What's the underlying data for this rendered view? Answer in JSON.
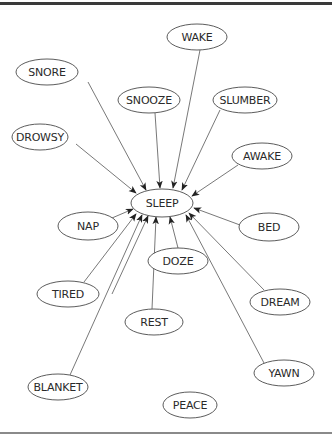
{
  "diagram": {
    "type": "semantic-association-network",
    "center": {
      "id": "sleep",
      "label": "SLEEP",
      "cx": 162,
      "cy": 203,
      "rx": 31,
      "ry": 14
    },
    "nodes": [
      {
        "id": "wake",
        "label": "WAKE",
        "cx": 197,
        "cy": 37,
        "rx": 30,
        "ry": 13
      },
      {
        "id": "snore",
        "label": "SNORE",
        "cx": 47,
        "cy": 72,
        "rx": 31,
        "ry": 13
      },
      {
        "id": "snooze",
        "label": "SNOOZE",
        "cx": 149,
        "cy": 100,
        "rx": 31,
        "ry": 13
      },
      {
        "id": "slumber",
        "label": "SLUMBER",
        "cx": 245,
        "cy": 100,
        "rx": 32,
        "ry": 13
      },
      {
        "id": "drowsy",
        "label": "DROWSY",
        "cx": 40,
        "cy": 137,
        "rx": 28,
        "ry": 13
      },
      {
        "id": "awake",
        "label": "AWAKE",
        "cx": 262,
        "cy": 156,
        "rx": 30,
        "ry": 13
      },
      {
        "id": "nap",
        "label": "NAP",
        "cx": 88,
        "cy": 226,
        "rx": 30,
        "ry": 14
      },
      {
        "id": "bed",
        "label": "BED",
        "cx": 269,
        "cy": 227,
        "rx": 30,
        "ry": 14
      },
      {
        "id": "doze",
        "label": "DOZE",
        "cx": 178,
        "cy": 261,
        "rx": 30,
        "ry": 13
      },
      {
        "id": "tired",
        "label": "TIRED",
        "cx": 68,
        "cy": 294,
        "rx": 31,
        "ry": 13
      },
      {
        "id": "dream",
        "label": "DREAM",
        "cx": 280,
        "cy": 302,
        "rx": 30,
        "ry": 13
      },
      {
        "id": "rest",
        "label": "REST",
        "cx": 154,
        "cy": 322,
        "rx": 29,
        "ry": 13
      },
      {
        "id": "blanket",
        "label": "BLANKET",
        "cx": 58,
        "cy": 387,
        "rx": 30,
        "ry": 13
      },
      {
        "id": "yawn",
        "label": "YAWN",
        "cx": 284,
        "cy": 373,
        "rx": 30,
        "ry": 13
      },
      {
        "id": "peace",
        "label": "PEACE",
        "cx": 190,
        "cy": 405,
        "rx": 27,
        "ry": 13
      }
    ],
    "edges": [
      {
        "from": "wake",
        "to": "sleep",
        "x1": 200,
        "y1": 50,
        "x2": 173,
        "y2": 188
      },
      {
        "from": "snore",
        "to": "sleep",
        "x1": 88,
        "y1": 82,
        "x2": 146,
        "y2": 190
      },
      {
        "from": "snooze",
        "to": "sleep",
        "x1": 155,
        "y1": 113,
        "x2": 160,
        "y2": 188
      },
      {
        "from": "slumber",
        "to": "sleep",
        "x1": 220,
        "y1": 110,
        "x2": 182,
        "y2": 190
      },
      {
        "from": "drowsy",
        "to": "sleep",
        "x1": 76,
        "y1": 144,
        "x2": 136,
        "y2": 193
      },
      {
        "from": "awake",
        "to": "sleep",
        "x1": 238,
        "y1": 165,
        "x2": 192,
        "y2": 196
      },
      {
        "from": "nap",
        "to": "sleep",
        "x1": 112,
        "y1": 218,
        "x2": 133,
        "y2": 209
      },
      {
        "from": "bed",
        "to": "sleep",
        "x1": 240,
        "y1": 225,
        "x2": 194,
        "y2": 208
      },
      {
        "from": "doze",
        "to": "sleep",
        "x1": 178,
        "y1": 248,
        "x2": 170,
        "y2": 217
      },
      {
        "from": "tired",
        "to": "sleep",
        "x1": 84,
        "y1": 282,
        "x2": 136,
        "y2": 214
      },
      {
        "from": "dream",
        "to": "sleep",
        "x1": 264,
        "y1": 290,
        "x2": 189,
        "y2": 213
      },
      {
        "from": "rest",
        "to": "sleep",
        "x1": 152,
        "y1": 309,
        "x2": 156,
        "y2": 217
      },
      {
        "from": "blanket",
        "to": "sleep",
        "x1": 70,
        "y1": 375,
        "x2": 142,
        "y2": 215
      },
      {
        "from": "yawn",
        "to": "sleep",
        "x1": 264,
        "y1": 363,
        "x2": 186,
        "y2": 215
      },
      {
        "from": "sleep-extra",
        "to": "sleep",
        "x1": 112,
        "y1": 294,
        "x2": 148,
        "y2": 216
      }
    ]
  }
}
